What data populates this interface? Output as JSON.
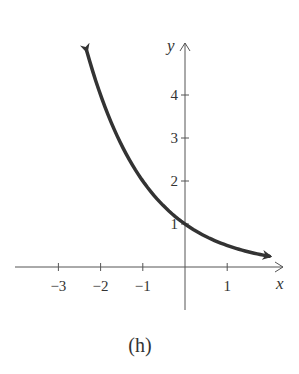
{
  "chart_data": {
    "type": "line",
    "title": "",
    "caption": "(h)",
    "function": "y = (1/2)^x",
    "xlabel": "x",
    "ylabel": "y",
    "x_ticks": [
      -3,
      -2,
      -1,
      1
    ],
    "x_tick_labels": [
      "−3",
      "−2",
      "−1",
      "1"
    ],
    "y_ticks": [
      1,
      2,
      3,
      4
    ],
    "y_tick_labels": [
      "1",
      "2",
      "3",
      "4"
    ],
    "xlim": [
      -3.9,
      2.3
    ],
    "ylim": [
      -1.0,
      5.2
    ],
    "grid": false,
    "legend": null,
    "series": [
      {
        "name": "curve",
        "x": [
          -2.33,
          -2,
          -1.5,
          -1,
          -0.5,
          0,
          0.5,
          1,
          1.5,
          2
        ],
        "y": [
          5.03,
          4,
          2.83,
          2,
          1.41,
          1,
          0.71,
          0.5,
          0.35,
          0.25
        ],
        "arrows_both_ends": true,
        "color": "#333333"
      }
    ],
    "y_intercept": 1
  },
  "colors": {
    "axis": "#555555",
    "curve": "#333333",
    "text": "#333333"
  }
}
